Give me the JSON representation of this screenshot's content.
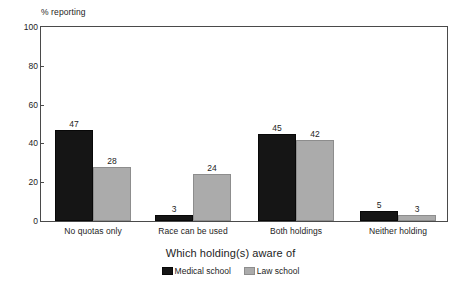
{
  "chart_data": {
    "type": "bar",
    "title": "",
    "categories": [
      "No quotas only",
      "Race can be used",
      "Both holdings",
      "Neither holding"
    ],
    "series": [
      {
        "name": "Medical school",
        "color": "#151515",
        "values": [
          47,
          3,
          45,
          5
        ]
      },
      {
        "name": "Law school",
        "color": "#ababab",
        "values": [
          28,
          24,
          42,
          3
        ]
      }
    ],
    "xlabel": "Which holding(s) aware of",
    "ylabel": "% reporting",
    "ylim": [
      0,
      100
    ],
    "yticks": [
      0,
      20,
      40,
      60,
      80,
      100
    ],
    "ytick_labels": [
      "0",
      "20",
      "40",
      "60",
      "80",
      "100"
    ],
    "grid": false,
    "legend_position": "bottom",
    "value_labels": true
  },
  "axis": {
    "y_title": "% reporting",
    "x_title": "Which holding(s) aware of"
  },
  "legend": {
    "items": [
      {
        "label": "Medical school",
        "color": "#151515"
      },
      {
        "label": "Law school",
        "color": "#ababab"
      }
    ]
  }
}
